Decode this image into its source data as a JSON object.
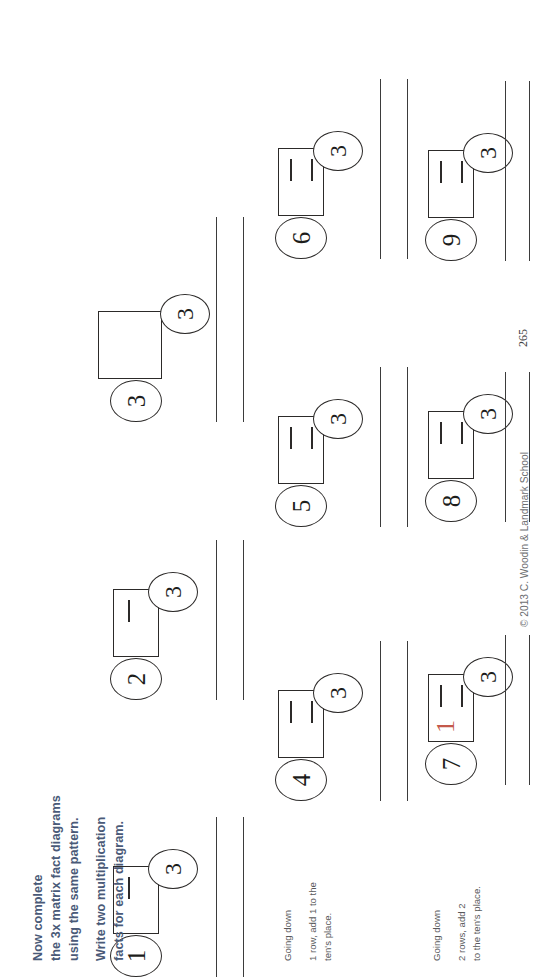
{
  "document": {
    "title": "3x Matrix Fact Diagrams Worksheet",
    "page_number": "265",
    "footer": "© 2013  C. Woodin & Landmark School",
    "heading_color": "#4a5a78",
    "handwriting_color": "#c4594b"
  },
  "instructions": {
    "line1": "Now complete",
    "line2": "the 3x matrix fact diagrams",
    "line3": "using the same pattern.",
    "line4": "Write two multiplication",
    "line5": "facts for each diagram."
  },
  "notes": [
    {
      "id": "note-row2",
      "line1": "Going down",
      "line2": "1 row, add 1 to the",
      "line3": "ten's place."
    },
    {
      "id": "note-row3",
      "line1": "Going down",
      "line2": "2 rows, add 2",
      "line3": "to the ten's place."
    }
  ],
  "diagrams": [
    {
      "id": "diagram-1",
      "multiplier": "1",
      "multiplicand": "3",
      "ticks": 1,
      "written_answer": ""
    },
    {
      "id": "diagram-2",
      "multiplier": "2",
      "multiplicand": "3",
      "ticks": 1,
      "written_answer": ""
    },
    {
      "id": "diagram-3",
      "multiplier": "3",
      "multiplicand": "3",
      "ticks": 0,
      "written_answer": ""
    },
    {
      "id": "diagram-4",
      "multiplier": "4",
      "multiplicand": "3",
      "ticks": 2,
      "written_answer": ""
    },
    {
      "id": "diagram-5",
      "multiplier": "5",
      "multiplicand": "3",
      "ticks": 2,
      "written_answer": ""
    },
    {
      "id": "diagram-6",
      "multiplier": "6",
      "multiplicand": "3",
      "ticks": 2,
      "written_answer": ""
    },
    {
      "id": "diagram-7",
      "multiplier": "7",
      "multiplicand": "3",
      "ticks": 2,
      "written_answer": "1"
    },
    {
      "id": "diagram-8",
      "multiplier": "8",
      "multiplicand": "3",
      "ticks": 2,
      "written_answer": ""
    },
    {
      "id": "diagram-9",
      "multiplier": "9",
      "multiplicand": "3",
      "ticks": 2,
      "written_answer": ""
    }
  ]
}
